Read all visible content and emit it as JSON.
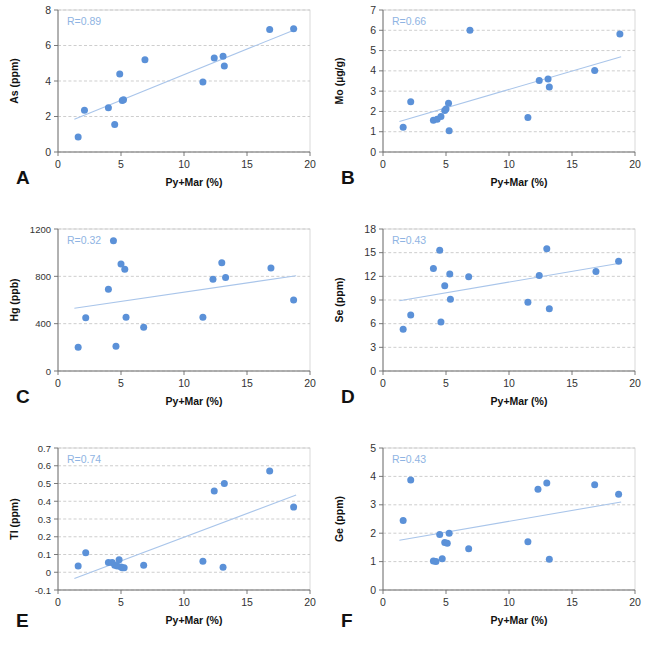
{
  "figure": {
    "marker_color": "#5b91d8",
    "trend_color": "#a9c5ea",
    "grid_color": "#b9b9b9",
    "background": "#ffffff",
    "shared_xlabel": "Py+Mar (%)",
    "shared_xticks": [
      "0",
      "5",
      "10",
      "15",
      "20"
    ],
    "shared_xlim": [
      0,
      20
    ]
  },
  "chart_data": [
    {
      "panel": "A",
      "type": "scatter",
      "title": "",
      "xlabel": "Py+Mar (%)",
      "ylabel": "As (ppm)",
      "annotation": "R=0.89",
      "r_value": 0.89,
      "xlim": [
        0,
        20
      ],
      "ylim": [
        0,
        8
      ],
      "xticks": [
        0,
        5,
        10,
        15,
        20
      ],
      "yticks": [
        0,
        2,
        4,
        6,
        8
      ],
      "xtick_labels": [
        "0",
        "5",
        "10",
        "15",
        "20"
      ],
      "ytick_labels": [
        "0",
        "2",
        "4",
        "6",
        "8"
      ],
      "grid": true,
      "legend": "none",
      "x": [
        1.6,
        2.1,
        4.0,
        4.5,
        4.9,
        5.1,
        5.2,
        6.9,
        11.5,
        12.4,
        13.1,
        13.2,
        16.8,
        18.7
      ],
      "y": [
        0.85,
        2.35,
        2.5,
        1.55,
        4.4,
        2.9,
        2.95,
        5.2,
        3.95,
        5.3,
        5.4,
        4.85,
        6.9,
        6.95
      ],
      "trendline": {
        "x0": 1.3,
        "y0": 1.85,
        "x1": 19.0,
        "y1": 6.95
      }
    },
    {
      "panel": "B",
      "type": "scatter",
      "title": "",
      "xlabel": "Py+Mar (%)",
      "ylabel": "Mo (µg/g)",
      "annotation": "R=0.66",
      "r_value": 0.66,
      "xlim": [
        0,
        20
      ],
      "ylim": [
        0,
        7
      ],
      "xticks": [
        0,
        5,
        10,
        15,
        20
      ],
      "yticks": [
        0,
        1,
        2,
        3,
        4,
        5,
        6,
        7
      ],
      "xtick_labels": [
        "0",
        "1",
        "2",
        "3",
        "4",
        "5",
        "6",
        "7"
      ],
      "ytick_labels": [
        "0",
        "1",
        "2",
        "3",
        "4",
        "5",
        "6",
        "7"
      ],
      "grid": true,
      "legend": "none",
      "x": [
        1.6,
        2.2,
        4.0,
        4.3,
        4.6,
        4.9,
        5.0,
        5.2,
        5.25,
        6.9,
        11.5,
        12.4,
        13.1,
        13.2,
        16.8,
        18.8
      ],
      "y": [
        1.22,
        2.48,
        1.56,
        1.62,
        1.75,
        2.05,
        2.12,
        2.4,
        1.05,
        6.0,
        1.7,
        3.52,
        3.6,
        3.2,
        4.02,
        5.82
      ],
      "trendline": {
        "x0": 1.3,
        "y0": 1.5,
        "x1": 18.9,
        "y1": 4.7
      }
    },
    {
      "panel": "C",
      "type": "scatter",
      "title": "",
      "xlabel": "Py+Mar (%)",
      "ylabel": "Hg (ppb)",
      "annotation": "R=0.32",
      "r_value": 0.32,
      "xlim": [
        0,
        20
      ],
      "ylim": [
        0,
        1200
      ],
      "xticks": [
        0,
        5,
        10,
        15,
        20
      ],
      "yticks": [
        0,
        400,
        800,
        1200
      ],
      "xtick_labels": [
        "0",
        "5",
        "10",
        "15",
        "20"
      ],
      "ytick_labels": [
        "0",
        "400",
        "800",
        "1200"
      ],
      "grid": true,
      "legend": "none",
      "x": [
        1.6,
        2.2,
        4.0,
        4.4,
        4.6,
        5.0,
        5.3,
        5.4,
        6.8,
        11.5,
        12.3,
        13.0,
        13.3,
        16.9,
        18.7
      ],
      "y": [
        200,
        450,
        690,
        1100,
        210,
        905,
        860,
        455,
        370,
        455,
        775,
        915,
        790,
        870,
        600
      ],
      "trendline": {
        "x0": 1.3,
        "y0": 530,
        "x1": 18.9,
        "y1": 805
      }
    },
    {
      "panel": "D",
      "type": "scatter",
      "title": "",
      "xlabel": "Py+Mar (%)",
      "ylabel": "Se (ppm)",
      "annotation": "R=0.43",
      "r_value": 0.43,
      "xlim": [
        0,
        20
      ],
      "ylim": [
        0,
        18
      ],
      "xticks": [
        0,
        5,
        10,
        15,
        20
      ],
      "yticks": [
        0,
        3,
        6,
        9,
        12,
        15,
        18
      ],
      "xtick_labels": [
        "0",
        "5",
        "10",
        "15",
        "20"
      ],
      "ytick_labels": [
        "0",
        "3",
        "6",
        "9",
        "12",
        "15",
        "18"
      ],
      "grid": true,
      "legend": "none",
      "x": [
        1.6,
        2.2,
        4.0,
        4.5,
        4.6,
        4.9,
        5.3,
        5.35,
        6.8,
        11.5,
        12.4,
        13.0,
        13.2,
        16.9,
        18.7
      ],
      "y": [
        5.3,
        7.1,
        13.0,
        15.3,
        6.2,
        10.8,
        12.3,
        9.1,
        11.95,
        8.7,
        12.1,
        15.5,
        7.9,
        12.6,
        13.9
      ],
      "trendline": {
        "x0": 1.3,
        "y0": 8.9,
        "x1": 18.9,
        "y1": 13.7
      }
    },
    {
      "panel": "E",
      "type": "scatter",
      "title": "",
      "xlabel": "Py+Mar (%)",
      "ylabel": "Tl (ppm)",
      "annotation": "R=0.74",
      "r_value": 0.74,
      "xlim": [
        0,
        20
      ],
      "ylim": [
        -0.1,
        0.7
      ],
      "xticks": [
        0,
        5,
        10,
        15,
        20
      ],
      "yticks": [
        -0.1,
        0,
        0.1,
        0.2,
        0.3,
        0.4,
        0.5,
        0.6,
        0.7
      ],
      "xtick_labels": [
        "0",
        "5",
        "10",
        "15",
        "20"
      ],
      "ytick_labels": [
        "-0.1",
        "0",
        "0.1",
        "0.2",
        "0.3",
        "0.4",
        "0.5",
        "0.6",
        "0.7"
      ],
      "grid": true,
      "legend": "none",
      "x": [
        1.6,
        2.2,
        4.0,
        4.3,
        4.5,
        4.7,
        4.85,
        5.0,
        5.1,
        5.25,
        6.8,
        11.5,
        13.1,
        12.4,
        13.2,
        16.8,
        18.7
      ],
      "y": [
        0.035,
        0.11,
        0.055,
        0.055,
        0.04,
        0.035,
        0.07,
        0.03,
        0.025,
        0.025,
        0.04,
        0.062,
        0.028,
        0.458,
        0.5,
        0.57,
        0.367
      ],
      "trendline": {
        "x0": 1.3,
        "y0": -0.035,
        "x1": 18.9,
        "y1": 0.435
      }
    },
    {
      "panel": "F",
      "type": "scatter",
      "title": "",
      "xlabel": "Py+Mar (%)",
      "ylabel": "Ge (ppm)",
      "annotation": "R=0.43",
      "r_value": 0.43,
      "xlim": [
        0,
        20
      ],
      "ylim": [
        0,
        5
      ],
      "xticks": [
        0,
        5,
        10,
        15,
        20
      ],
      "yticks": [
        0,
        1,
        2,
        3,
        4,
        5
      ],
      "xtick_labels": [
        "0",
        "5",
        "10",
        "15",
        "20"
      ],
      "ytick_labels": [
        "0",
        "1",
        "2",
        "3",
        "4",
        "5"
      ],
      "grid": true,
      "legend": "none",
      "x": [
        1.6,
        2.2,
        4.0,
        4.2,
        4.5,
        4.7,
        4.9,
        5.1,
        5.25,
        6.8,
        11.5,
        12.3,
        13.0,
        13.2,
        16.8,
        18.7
      ],
      "y": [
        2.45,
        3.87,
        1.02,
        1.0,
        1.95,
        1.1,
        1.67,
        1.65,
        2.0,
        1.45,
        1.7,
        3.55,
        3.77,
        1.08,
        3.71,
        3.37
      ],
      "trendline": {
        "x0": 1.3,
        "y0": 1.75,
        "x1": 18.9,
        "y1": 3.1
      }
    }
  ],
  "panel_labels": [
    "A",
    "B",
    "C",
    "D",
    "E",
    "F"
  ]
}
